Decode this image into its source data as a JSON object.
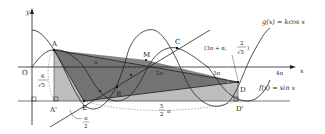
{
  "diagram": {
    "axes": {
      "x_label": "x",
      "y_label": "y",
      "origin_label": "O",
      "tick_labels": [
        "π",
        "2π",
        "3π",
        "4π"
      ]
    },
    "functions": [
      {
        "label": "g(x) = kcos x"
      },
      {
        "label": "f(x) = sin x"
      }
    ],
    "points": [
      {
        "id": "A",
        "label": "A"
      },
      {
        "id": "A_prime",
        "label": "A'"
      },
      {
        "id": "B",
        "label": "B"
      },
      {
        "id": "C",
        "label": "C"
      },
      {
        "id": "D",
        "label": "D"
      },
      {
        "id": "D_prime",
        "label": "D'"
      },
      {
        "id": "E",
        "label": "E"
      },
      {
        "id": "M",
        "label": "M"
      }
    ],
    "annotations": {
      "point_coord_open": "(3π + α,",
      "point_coord_num": "2",
      "point_coord_den": "√5",
      "point_coord_close": ")",
      "height_num": "6",
      "height_den": "√5",
      "angle_num": "π",
      "angle_den": "2",
      "length_num": "5",
      "length_den": "2",
      "length_suffix": "π"
    },
    "colors": {
      "dark_fill": "#6e6e6e",
      "mid_fill": "#9a9a9a",
      "light_fill": "#bdbdbd",
      "line": "#222222"
    }
  }
}
